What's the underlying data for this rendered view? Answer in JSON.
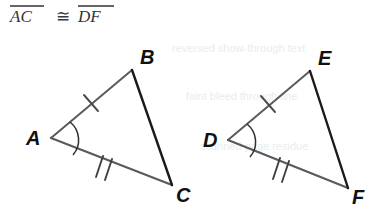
{
  "figure": {
    "background_color": "#ffffff",
    "statement": {
      "left_segment": "AC",
      "congruent_symbol": "≅",
      "right_segment": "DF",
      "full_text": "AC ≅ DF",
      "color": "#333333",
      "overline_color": "#333333"
    },
    "colors": {
      "light_side": "#5a5a5a",
      "dark_side": "#1a1a1a",
      "mark": "#4a4a4a",
      "arc": "#2e2e2e",
      "label": "#111111",
      "ghost": "#d8dde2"
    },
    "triangles": [
      {
        "name": "triangle-abc",
        "vertices": [
          {
            "label": "A",
            "x": 51,
            "y": 138,
            "label_x": 26,
            "label_y": 145
          },
          {
            "label": "B",
            "x": 132,
            "y": 70,
            "label_x": 140,
            "label_y": 64
          },
          {
            "label": "C",
            "x": 172,
            "y": 185,
            "label_x": 176,
            "label_y": 202
          }
        ],
        "sides": [
          {
            "name": "side-ab",
            "from": "A",
            "to": "B",
            "shade": "light",
            "ticks": 1
          },
          {
            "name": "side-ac",
            "from": "A",
            "to": "C",
            "shade": "light",
            "ticks": 2
          },
          {
            "name": "side-bc",
            "from": "B",
            "to": "C",
            "shade": "dark",
            "ticks": 0
          }
        ],
        "angle_mark": {
          "at": "A",
          "radius": 23
        }
      },
      {
        "name": "triangle-def",
        "vertices": [
          {
            "label": "D",
            "x": 228,
            "y": 140,
            "label_x": 203,
            "label_y": 147
          },
          {
            "label": "E",
            "x": 310,
            "y": 71,
            "label_x": 318,
            "label_y": 65
          },
          {
            "label": "F",
            "x": 348,
            "y": 188,
            "label_x": 352,
            "label_y": 204
          }
        ],
        "sides": [
          {
            "name": "side-de",
            "from": "D",
            "to": "E",
            "shade": "light",
            "ticks": 1
          },
          {
            "name": "side-df",
            "from": "D",
            "to": "F",
            "shade": "light",
            "ticks": 2
          },
          {
            "name": "side-ef",
            "from": "E",
            "to": "F",
            "shade": "dark",
            "ticks": 0
          }
        ],
        "angle_mark": {
          "at": "D",
          "radius": 23
        }
      }
    ],
    "ghost_artifacts": [
      {
        "text": "reversed show-through text",
        "x": 170,
        "y": 52
      },
      {
        "text": "faint bleed through line",
        "x": 185,
        "y": 100
      },
      {
        "text": "scanned page residue",
        "x": 200,
        "y": 150
      }
    ]
  }
}
